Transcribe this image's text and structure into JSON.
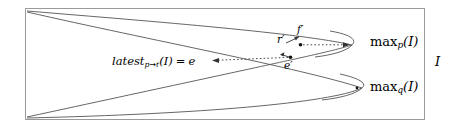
{
  "figure": {
    "name": "interval-lens-diagram",
    "background": "#ffffff",
    "stroke": "#555555",
    "box": {
      "x": 25,
      "y": 8,
      "width": 400,
      "height": 112,
      "border_color": "#9a9a9a",
      "label": "I"
    },
    "labels": {
      "latest": {
        "prefix": "latest",
        "subscript": "p",
        "arrow": "→",
        "subscript2": "r",
        "arg": "(I)",
        "equals": "=",
        "value": "e"
      },
      "max_p": {
        "base": "max",
        "subscript": "p",
        "arg": "(I)"
      },
      "max_q": {
        "base": "max",
        "subscript": "q",
        "arg": "(I)"
      },
      "interval": "I",
      "r_prime": "r′",
      "f_prime": "f′",
      "e_prime": "e′"
    },
    "points": [
      {
        "name": "f-prime-point",
        "x": 300,
        "y": 45
      },
      {
        "name": "e-prime-point",
        "x": 291,
        "y": 57
      },
      {
        "name": "max-q-point",
        "x": 357,
        "y": 88
      }
    ],
    "arrows": [
      {
        "name": "f-prime-to-max-p",
        "style": "dotted",
        "from": [
          302,
          45
        ],
        "to": [
          348,
          45
        ]
      },
      {
        "name": "e-prime-to-latest",
        "style": "dotted",
        "from": [
          289,
          57
        ],
        "to": [
          213,
          60
        ]
      },
      {
        "name": "r-prime-to-f-prime",
        "style": "solid",
        "from": [
          285,
          43
        ],
        "to": [
          298,
          36
        ]
      },
      {
        "name": "e-prime-marker",
        "style": "solid",
        "from": [
          283,
          55
        ],
        "to": [
          290,
          57
        ]
      }
    ],
    "curves": [
      {
        "name": "curve-p",
        "description": "parabola opening left, apex near max_p",
        "apex": [
          352,
          45
        ]
      },
      {
        "name": "curve-q",
        "description": "parabola opening left, apex near max_q",
        "apex": [
          362,
          88
        ]
      }
    ]
  }
}
